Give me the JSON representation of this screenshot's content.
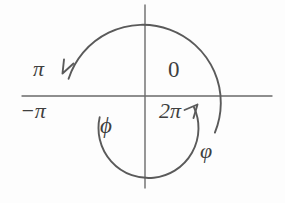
{
  "figure": {
    "background_color": "#fdfdfd",
    "stroke_color": "#5a5a5a",
    "axis_color": "#6a6a6a",
    "label_color": "#3f3f3f",
    "width": 285,
    "height": 203,
    "origin": {
      "x": 145,
      "y": 96
    }
  },
  "axes": {
    "horizontal": {
      "x1": 22,
      "y1": 96,
      "x2": 272,
      "y2": 96
    },
    "vertical": {
      "x1": 145,
      "y1": 5,
      "x2": 145,
      "y2": 188
    }
  },
  "arcs": [
    {
      "name": "outer-arc-varphi",
      "symbol": "varphi",
      "radius": 78,
      "direction": "clockwise",
      "start_angle_deg": -28,
      "end_angle_deg": 168,
      "arrow_at": "end",
      "arrow_point": {
        "x": 62,
        "y": 72
      }
    },
    {
      "name": "inner-arc-phi",
      "symbol": "phi",
      "radius": 50,
      "direction": "counterclockwise",
      "start_angle_deg": 205,
      "end_angle_deg": 12,
      "arrow_at": "end",
      "arrow_point": {
        "x": 198,
        "y": 107
      }
    }
  ],
  "labels": {
    "pi": "π",
    "negative_pi": "−π",
    "zero": "0",
    "two_pi": "2π",
    "phi_inner": "ϕ",
    "phi_outer": "φ"
  }
}
